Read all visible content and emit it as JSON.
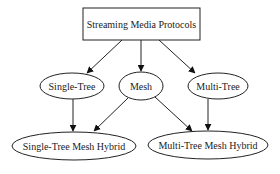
{
  "diagram": {
    "type": "directed-graph",
    "nodes": {
      "root": {
        "label": "Streaming Media Protocols",
        "shape": "box",
        "cx": 141,
        "cy": 24,
        "w": 117,
        "h": 32
      },
      "single_tree": {
        "label": "Single-Tree",
        "shape": "ellipse",
        "cx": 72,
        "cy": 86,
        "rx": 32,
        "ry": 13
      },
      "mesh": {
        "label": "Mesh",
        "shape": "ellipse",
        "cx": 141,
        "cy": 86,
        "rx": 22,
        "ry": 14
      },
      "multi_tree": {
        "label": "Multi-Tree",
        "shape": "ellipse",
        "cx": 218,
        "cy": 86,
        "rx": 30,
        "ry": 13
      },
      "single_tree_mesh_hybrid": {
        "label": "Single-Tree Mesh Hybrid",
        "shape": "ellipse",
        "cx": 74,
        "cy": 146,
        "rx": 62,
        "ry": 14
      },
      "multi_tree_mesh_hybrid": {
        "label": "Multi-Tree Mesh Hybrid",
        "shape": "ellipse",
        "cx": 208,
        "cy": 145,
        "rx": 60,
        "ry": 14
      }
    },
    "edges": [
      {
        "from": "Streaming Media Protocols",
        "to": "Single-Tree"
      },
      {
        "from": "Streaming Media Protocols",
        "to": "Mesh"
      },
      {
        "from": "Streaming Media Protocols",
        "to": "Multi-Tree"
      },
      {
        "from": "Single-Tree",
        "to": "Single-Tree Mesh Hybrid"
      },
      {
        "from": "Mesh",
        "to": "Single-Tree Mesh Hybrid"
      },
      {
        "from": "Mesh",
        "to": "Multi-Tree Mesh Hybrid"
      },
      {
        "from": "Multi-Tree",
        "to": "Multi-Tree Mesh Hybrid"
      }
    ]
  }
}
